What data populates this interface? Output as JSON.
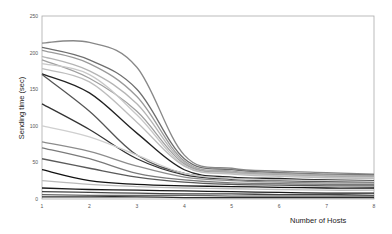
{
  "chart_data": {
    "type": "line",
    "title": "",
    "xlabel": "Number of Hosts",
    "ylabel": "Sending time (sec)",
    "x": [
      1,
      2,
      3,
      4,
      5,
      6,
      7,
      8
    ],
    "xticks": [
      "1",
      "2",
      "3",
      "4",
      "5",
      "6",
      "7",
      "8"
    ],
    "yticks": [
      "0",
      "50",
      "100",
      "150",
      "200",
      "250"
    ],
    "xlim": [
      1,
      8
    ],
    "ylim": [
      0,
      250
    ],
    "grid": false,
    "legend": "none",
    "series": [
      {
        "name": "s1",
        "color": "#888888",
        "values": [
          213,
          214,
          180,
          60,
          42,
          38,
          36,
          34
        ]
      },
      {
        "name": "s2",
        "color": "#6e6e6e",
        "values": [
          207,
          190,
          150,
          55,
          40,
          36,
          34,
          33
        ]
      },
      {
        "name": "s3",
        "color": "#9a9a9a",
        "values": [
          203,
          185,
          140,
          52,
          38,
          35,
          33,
          32
        ]
      },
      {
        "name": "s4",
        "color": "#b5b5b5",
        "values": [
          195,
          175,
          130,
          50,
          37,
          34,
          32,
          31
        ]
      },
      {
        "name": "s5",
        "color": "#a0a0a0",
        "values": [
          190,
          165,
          120,
          48,
          36,
          33,
          31,
          30
        ]
      },
      {
        "name": "s6",
        "color": "#c8c8c8",
        "values": [
          185,
          170,
          115,
          46,
          35,
          32,
          30,
          29
        ]
      },
      {
        "name": "s7",
        "color": "#bdbdbd",
        "values": [
          178,
          160,
          105,
          45,
          34,
          31,
          29,
          28
        ]
      },
      {
        "name": "s8",
        "color": "#222222",
        "values": [
          171,
          145,
          90,
          40,
          30,
          28,
          26,
          25
        ]
      },
      {
        "name": "s9",
        "color": "#555555",
        "values": [
          170,
          120,
          60,
          35,
          28,
          26,
          25,
          24
        ]
      },
      {
        "name": "s10",
        "color": "#333333",
        "values": [
          130,
          95,
          55,
          33,
          27,
          25,
          24,
          23
        ]
      },
      {
        "name": "s11",
        "color": "#cfcfcf",
        "values": [
          100,
          85,
          60,
          35,
          28,
          26,
          25,
          24
        ]
      },
      {
        "name": "s12",
        "color": "#8c8c8c",
        "values": [
          78,
          65,
          45,
          30,
          25,
          23,
          22,
          22
        ]
      },
      {
        "name": "s13",
        "color": "#7a7a7a",
        "values": [
          70,
          55,
          35,
          26,
          22,
          21,
          20,
          20
        ]
      },
      {
        "name": "s14",
        "color": "#5a5a5a",
        "values": [
          55,
          42,
          30,
          23,
          20,
          19,
          18,
          18
        ]
      },
      {
        "name": "s15",
        "color": "#111111",
        "values": [
          40,
          25,
          20,
          18,
          17,
          16,
          15,
          15
        ]
      },
      {
        "name": "s16",
        "color": "#bbbbbb",
        "values": [
          25,
          20,
          17,
          15,
          14,
          13,
          12,
          12
        ]
      },
      {
        "name": "s17",
        "color": "#1a1a1a",
        "values": [
          15,
          13,
          12,
          11,
          10,
          9,
          8,
          8
        ]
      },
      {
        "name": "s18",
        "color": "#444444",
        "values": [
          10,
          9,
          8,
          7,
          7,
          6,
          6,
          5
        ]
      },
      {
        "name": "s19",
        "color": "#666666",
        "values": [
          6,
          5,
          5,
          5,
          4,
          4,
          4,
          4
        ]
      },
      {
        "name": "s20",
        "color": "#2b2b2b",
        "values": [
          3,
          3,
          3,
          2,
          2,
          2,
          2,
          2
        ]
      }
    ]
  }
}
